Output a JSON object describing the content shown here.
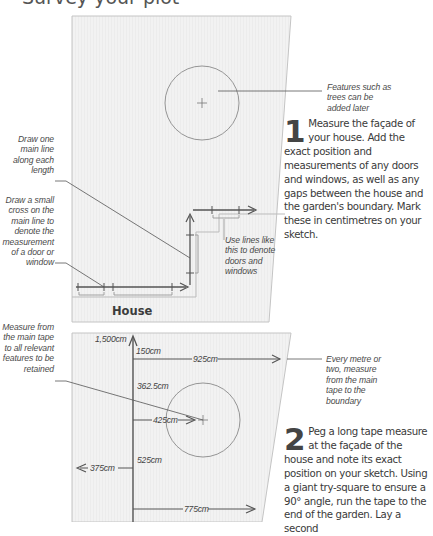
{
  "heading": {
    "text": "Survey your plot"
  },
  "annotations": {
    "features_trees": "Features such as trees can be added later",
    "draw_main_line": "Draw one main line along each length",
    "draw_cross": "Draw a small cross on the main line to denote the measurement of a door or window",
    "use_lines": "Use lines like this to denote doors and windows",
    "measure_from_tape": "Measure from the main tape to all relevant features to be retained",
    "every_metre": "Every metre or two, measure from the main tape to the boundary"
  },
  "house_label": "House",
  "steps": [
    {
      "number": "1",
      "text": "Measure the façade of your house. Add the exact position and measurements of any doors and windows, as well as any gaps between the house and the garden's boundary. Mark these in centimetres on your sketch."
    },
    {
      "number": "2",
      "text": "Peg a long tape measure at the façade of the house and note its exact position on your sketch. Using a giant try-square to ensure a 90° angle, run the tape to the end of the garden. Lay a second"
    }
  ],
  "measurements": {
    "tape_length": "1,500cm",
    "m150": "150cm",
    "m925": "925cm",
    "m362": "362.5cm",
    "m425": "425cm",
    "m525": "525cm",
    "m375": "375cm",
    "m775": "775cm"
  },
  "colors": {
    "panel_fill": "#f1f1f1",
    "panel_stroke": "#bdbdbd",
    "line_dark": "#555555",
    "line_light": "#9a9a9a"
  }
}
